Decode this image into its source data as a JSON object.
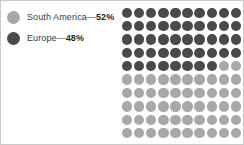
{
  "figure": {
    "background_color": "#ffffff",
    "border_color": "#c9c9c9"
  },
  "legend": {
    "items": [
      {
        "label": "South America—52%",
        "name": "South America",
        "value_text": "52%",
        "color": "#a8a8a8",
        "swatch_name": "legend-swatch-south-america"
      },
      {
        "label": "Europe—48%",
        "name": "Europe",
        "value_text": "48%",
        "color": "#4a4a4a",
        "swatch_name": "legend-swatch-europe"
      }
    ]
  },
  "chart_data": {
    "type": "pie",
    "title": "",
    "subtitle": "",
    "xlabel": "",
    "ylabel": "",
    "render_style": "waffle-dot-matrix",
    "categories": [
      "Europe",
      "South America"
    ],
    "values": [
      48,
      52
    ],
    "unit": "%",
    "colors": [
      "#4a4a4a",
      "#a8a8a8"
    ],
    "legend_position": "left",
    "grid": false,
    "matrix": {
      "columns": 10,
      "rows": 10,
      "total_dots": 100,
      "dot_value": 1,
      "fill_order": "row-major-top-left",
      "dark_dots": 48,
      "light_dots": 52,
      "transition_row_index": 4,
      "transition_row_dark_count": 8,
      "transition_row_light_count": 2
    },
    "annotations": [
      "South America—52%",
      "Europe—48%"
    ]
  }
}
